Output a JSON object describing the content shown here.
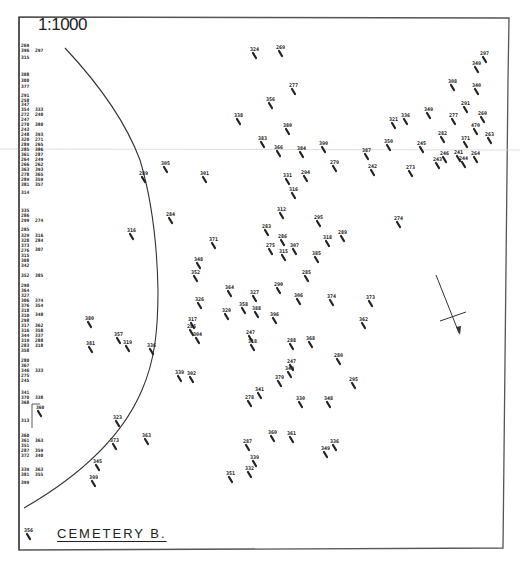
{
  "map": {
    "scale": "1:1000",
    "title": "CEMETERY B.",
    "colors": {
      "ink": "#222222",
      "paper": "#ffffff",
      "frame": "#555555",
      "crease": "#cfcfcf"
    }
  },
  "margin_list": {
    "col1": [
      {
        "y": 47,
        "t": "269"
      },
      {
        "y": 52,
        "t": "396"
      },
      {
        "y": 59,
        "t": "315"
      },
      {
        "y": 76,
        "t": "308"
      },
      {
        "y": 82,
        "t": "300"
      },
      {
        "y": 88,
        "t": "377"
      },
      {
        "y": 97,
        "t": "291"
      },
      {
        "y": 102,
        "t": "258"
      },
      {
        "y": 106,
        "t": "347"
      },
      {
        "y": 111,
        "t": "354"
      },
      {
        "y": 116,
        "t": "272"
      },
      {
        "y": 121,
        "t": "247"
      },
      {
        "y": 126,
        "t": "270"
      },
      {
        "y": 131,
        "t": "243"
      },
      {
        "y": 136,
        "t": "248"
      },
      {
        "y": 141,
        "t": "320"
      },
      {
        "y": 146,
        "t": "289"
      },
      {
        "y": 151,
        "t": "285"
      },
      {
        "y": 156,
        "t": "361"
      },
      {
        "y": 161,
        "t": "264"
      },
      {
        "y": 166,
        "t": "266"
      },
      {
        "y": 171,
        "t": "363"
      },
      {
        "y": 176,
        "t": "278"
      },
      {
        "y": 181,
        "t": "289"
      },
      {
        "y": 186,
        "t": "381"
      },
      {
        "y": 194,
        "t": "314"
      },
      {
        "y": 212,
        "t": "335"
      },
      {
        "y": 217,
        "t": "286"
      },
      {
        "y": 222,
        "t": "299"
      },
      {
        "y": 231,
        "t": "285"
      },
      {
        "y": 237,
        "t": "329"
      },
      {
        "y": 242,
        "t": "328"
      },
      {
        "y": 247,
        "t": "373"
      },
      {
        "y": 252,
        "t": "276"
      },
      {
        "y": 257,
        "t": "315"
      },
      {
        "y": 262,
        "t": "308"
      },
      {
        "y": 267,
        "t": "342"
      },
      {
        "y": 277,
        "t": "352"
      },
      {
        "y": 287,
        "t": "290"
      },
      {
        "y": 292,
        "t": "364"
      },
      {
        "y": 297,
        "t": "327"
      },
      {
        "y": 302,
        "t": "306"
      },
      {
        "y": 307,
        "t": "376"
      },
      {
        "y": 312,
        "t": "318"
      },
      {
        "y": 317,
        "t": "310"
      },
      {
        "y": 322,
        "t": "298"
      },
      {
        "y": 327,
        "t": "317"
      },
      {
        "y": 332,
        "t": "316"
      },
      {
        "y": 337,
        "t": "344"
      },
      {
        "y": 342,
        "t": "319"
      },
      {
        "y": 347,
        "t": "283"
      },
      {
        "y": 352,
        "t": "358"
      },
      {
        "y": 362,
        "t": "280"
      },
      {
        "y": 367,
        "t": "367"
      },
      {
        "y": 372,
        "t": "346"
      },
      {
        "y": 377,
        "t": "275"
      },
      {
        "y": 382,
        "t": "245"
      },
      {
        "y": 394,
        "t": "341"
      },
      {
        "y": 399,
        "t": "370"
      },
      {
        "y": 404,
        "t": "368"
      },
      {
        "y": 422,
        "t": "313"
      },
      {
        "y": 437,
        "t": "360"
      },
      {
        "y": 442,
        "t": "361"
      },
      {
        "y": 447,
        "t": "351"
      },
      {
        "y": 452,
        "t": "287"
      },
      {
        "y": 457,
        "t": "372"
      },
      {
        "y": 471,
        "t": "339"
      },
      {
        "y": 476,
        "t": "381"
      },
      {
        "y": 484,
        "t": "399"
      }
    ],
    "col2": [
      {
        "y": 52,
        "t": "297"
      },
      {
        "y": 111,
        "t": "333"
      },
      {
        "y": 116,
        "t": "240"
      },
      {
        "y": 126,
        "t": "380"
      },
      {
        "y": 136,
        "t": "393"
      },
      {
        "y": 141,
        "t": "271"
      },
      {
        "y": 146,
        "t": "265"
      },
      {
        "y": 151,
        "t": "386"
      },
      {
        "y": 156,
        "t": "287"
      },
      {
        "y": 161,
        "t": "249"
      },
      {
        "y": 166,
        "t": "262"
      },
      {
        "y": 171,
        "t": "393"
      },
      {
        "y": 176,
        "t": "365"
      },
      {
        "y": 181,
        "t": "359"
      },
      {
        "y": 186,
        "t": "357"
      },
      {
        "y": 222,
        "t": "274"
      },
      {
        "y": 237,
        "t": "316"
      },
      {
        "y": 242,
        "t": "284"
      },
      {
        "y": 251,
        "t": "307"
      },
      {
        "y": 277,
        "t": "385"
      },
      {
        "y": 302,
        "t": "374"
      },
      {
        "y": 307,
        "t": "354"
      },
      {
        "y": 316,
        "t": "348"
      },
      {
        "y": 327,
        "t": "362"
      },
      {
        "y": 332,
        "t": "358"
      },
      {
        "y": 337,
        "t": "337"
      },
      {
        "y": 342,
        "t": "288"
      },
      {
        "y": 347,
        "t": "318"
      },
      {
        "y": 372,
        "t": "333"
      },
      {
        "y": 399,
        "t": "338"
      },
      {
        "y": 442,
        "t": "363"
      },
      {
        "y": 452,
        "t": "359"
      },
      {
        "y": 457,
        "t": "340"
      },
      {
        "y": 471,
        "t": "363"
      },
      {
        "y": 476,
        "t": "355"
      }
    ],
    "boxed_grave": {
      "label": "360",
      "x": 38,
      "y": 411
    }
  },
  "graves": [
    {
      "x": 254,
      "y": 54,
      "t": "324"
    },
    {
      "x": 280,
      "y": 52,
      "t": "269"
    },
    {
      "x": 484,
      "y": 58,
      "t": "297"
    },
    {
      "x": 476,
      "y": 68,
      "t": "349"
    },
    {
      "x": 293,
      "y": 90,
      "t": "277"
    },
    {
      "x": 452,
      "y": 86,
      "t": "308"
    },
    {
      "x": 476,
      "y": 90,
      "t": "340"
    },
    {
      "x": 270,
      "y": 104,
      "t": "356"
    },
    {
      "x": 465,
      "y": 108,
      "t": "291"
    },
    {
      "x": 238,
      "y": 120,
      "t": "338"
    },
    {
      "x": 428,
      "y": 114,
      "t": "349"
    },
    {
      "x": 405,
      "y": 120,
      "t": "336"
    },
    {
      "x": 393,
      "y": 124,
      "t": "321"
    },
    {
      "x": 453,
      "y": 120,
      "t": "277"
    },
    {
      "x": 482,
      "y": 118,
      "t": "260"
    },
    {
      "x": 475,
      "y": 130,
      "t": "470"
    },
    {
      "x": 287,
      "y": 130,
      "t": "380"
    },
    {
      "x": 262,
      "y": 143,
      "t": "383"
    },
    {
      "x": 442,
      "y": 138,
      "t": "282"
    },
    {
      "x": 489,
      "y": 139,
      "t": "263"
    },
    {
      "x": 465,
      "y": 143,
      "t": "371"
    },
    {
      "x": 388,
      "y": 146,
      "t": "350"
    },
    {
      "x": 323,
      "y": 148,
      "t": "390"
    },
    {
      "x": 421,
      "y": 148,
      "t": "245"
    },
    {
      "x": 278,
      "y": 152,
      "t": "366"
    },
    {
      "x": 301,
      "y": 153,
      "t": "384"
    },
    {
      "x": 366,
      "y": 155,
      "t": "387"
    },
    {
      "x": 444,
      "y": 158,
      "t": "246"
    },
    {
      "x": 458,
      "y": 157,
      "t": "241"
    },
    {
      "x": 475,
      "y": 158,
      "t": "264"
    },
    {
      "x": 463,
      "y": 163,
      "t": "244"
    },
    {
      "x": 437,
      "y": 164,
      "t": "243"
    },
    {
      "x": 334,
      "y": 167,
      "t": "279"
    },
    {
      "x": 165,
      "y": 168,
      "t": "305"
    },
    {
      "x": 372,
      "y": 171,
      "t": "242"
    },
    {
      "x": 410,
      "y": 172,
      "t": "273"
    },
    {
      "x": 143,
      "y": 178,
      "t": "289"
    },
    {
      "x": 204,
      "y": 178,
      "t": "301"
    },
    {
      "x": 287,
      "y": 180,
      "t": "331"
    },
    {
      "x": 305,
      "y": 177,
      "t": "294"
    },
    {
      "x": 293,
      "y": 194,
      "t": "316"
    },
    {
      "x": 281,
      "y": 214,
      "t": "312"
    },
    {
      "x": 170,
      "y": 219,
      "t": "284"
    },
    {
      "x": 318,
      "y": 222,
      "t": "295"
    },
    {
      "x": 398,
      "y": 223,
      "t": "274"
    },
    {
      "x": 131,
      "y": 235,
      "t": "316"
    },
    {
      "x": 266,
      "y": 231,
      "t": "283"
    },
    {
      "x": 342,
      "y": 237,
      "t": "289"
    },
    {
      "x": 282,
      "y": 241,
      "t": "286"
    },
    {
      "x": 327,
      "y": 242,
      "t": "318"
    },
    {
      "x": 213,
      "y": 244,
      "t": "371"
    },
    {
      "x": 270,
      "y": 250,
      "t": "275"
    },
    {
      "x": 294,
      "y": 250,
      "t": "307"
    },
    {
      "x": 283,
      "y": 256,
      "t": "315"
    },
    {
      "x": 316,
      "y": 258,
      "t": "385"
    },
    {
      "x": 198,
      "y": 264,
      "t": "348"
    },
    {
      "x": 195,
      "y": 277,
      "t": "352"
    },
    {
      "x": 306,
      "y": 277,
      "t": "285"
    },
    {
      "x": 229,
      "y": 292,
      "t": "364"
    },
    {
      "x": 278,
      "y": 289,
      "t": "290"
    },
    {
      "x": 254,
      "y": 297,
      "t": "327"
    },
    {
      "x": 298,
      "y": 300,
      "t": "306"
    },
    {
      "x": 331,
      "y": 301,
      "t": "374"
    },
    {
      "x": 370,
      "y": 302,
      "t": "373"
    },
    {
      "x": 199,
      "y": 304,
      "t": "326"
    },
    {
      "x": 243,
      "y": 309,
      "t": "358"
    },
    {
      "x": 256,
      "y": 313,
      "t": "388"
    },
    {
      "x": 226,
      "y": 315,
      "t": "320"
    },
    {
      "x": 274,
      "y": 319,
      "t": "396"
    },
    {
      "x": 363,
      "y": 324,
      "t": "362"
    },
    {
      "x": 89,
      "y": 323,
      "t": "380"
    },
    {
      "x": 192,
      "y": 324,
      "t": "317"
    },
    {
      "x": 191,
      "y": 331,
      "t": "286"
    },
    {
      "x": 197,
      "y": 339,
      "t": "304"
    },
    {
      "x": 118,
      "y": 339,
      "t": "357"
    },
    {
      "x": 250,
      "y": 337,
      "t": "247"
    },
    {
      "x": 252,
      "y": 346,
      "t": "318"
    },
    {
      "x": 90,
      "y": 348,
      "t": "381"
    },
    {
      "x": 127,
      "y": 347,
      "t": "319"
    },
    {
      "x": 151,
      "y": 350,
      "t": "336"
    },
    {
      "x": 291,
      "y": 345,
      "t": "288"
    },
    {
      "x": 310,
      "y": 343,
      "t": "368"
    },
    {
      "x": 338,
      "y": 360,
      "t": "280"
    },
    {
      "x": 291,
      "y": 366,
      "t": "247"
    },
    {
      "x": 179,
      "y": 377,
      "t": "339"
    },
    {
      "x": 191,
      "y": 378,
      "t": "302"
    },
    {
      "x": 279,
      "y": 382,
      "t": "379"
    },
    {
      "x": 289,
      "y": 373,
      "t": "349"
    },
    {
      "x": 353,
      "y": 384,
      "t": "295"
    },
    {
      "x": 259,
      "y": 394,
      "t": "341"
    },
    {
      "x": 249,
      "y": 402,
      "t": "278"
    },
    {
      "x": 300,
      "y": 403,
      "t": "330"
    },
    {
      "x": 328,
      "y": 403,
      "t": "348"
    },
    {
      "x": 117,
      "y": 422,
      "t": "323"
    },
    {
      "x": 146,
      "y": 440,
      "t": "363"
    },
    {
      "x": 114,
      "y": 445,
      "t": "373"
    },
    {
      "x": 272,
      "y": 437,
      "t": "360"
    },
    {
      "x": 291,
      "y": 438,
      "t": "361"
    },
    {
      "x": 334,
      "y": 446,
      "t": "336"
    },
    {
      "x": 247,
      "y": 446,
      "t": "287"
    },
    {
      "x": 325,
      "y": 453,
      "t": "349"
    },
    {
      "x": 97,
      "y": 466,
      "t": "345"
    },
    {
      "x": 254,
      "y": 462,
      "t": "339"
    },
    {
      "x": 249,
      "y": 473,
      "t": "332"
    },
    {
      "x": 230,
      "y": 478,
      "t": "351"
    },
    {
      "x": 93,
      "y": 482,
      "t": "399"
    },
    {
      "x": 28,
      "y": 535,
      "t": "356"
    }
  ],
  "north_arrow": {
    "label": "north-arrow"
  }
}
